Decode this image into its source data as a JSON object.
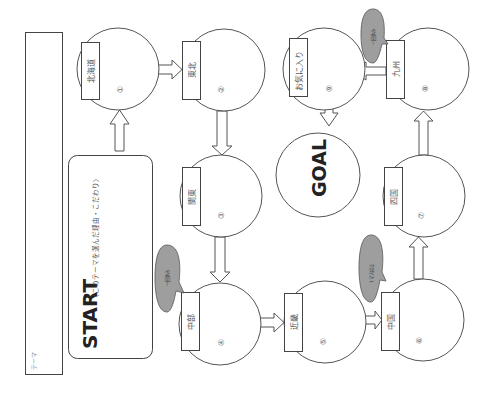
{
  "worksheet": {
    "orientation": "rotated-90-ccw",
    "theme_box": {
      "label": "テーマ"
    },
    "start": {
      "title": "START",
      "note": "〈このテーマを選んだ理由・こだわり〉"
    },
    "goal": {
      "label": "GOAL"
    },
    "stops": [
      {
        "number": "①",
        "region": "北海道"
      },
      {
        "number": "②",
        "region": "東北"
      },
      {
        "number": "③",
        "region": "関東"
      },
      {
        "number": "④",
        "region": "中部"
      },
      {
        "number": "⑤",
        "region": "近畿"
      },
      {
        "number": "⑥",
        "region": "中国"
      },
      {
        "number": "⑦",
        "region": "四国"
      },
      {
        "number": "⑧",
        "region": "九州"
      },
      {
        "number": "⑨",
        "region": "お気に入り"
      }
    ],
    "balloons": [
      {
        "attached_to": "④",
        "text": "一回休み"
      },
      {
        "attached_to": "⑥",
        "text": "1マス戻る"
      },
      {
        "attached_to": "⑧",
        "text": "一回休み"
      }
    ],
    "flow": [
      "START",
      "①",
      "②",
      "③",
      "④",
      "⑤",
      "⑥",
      "⑦",
      "⑧",
      "⑨",
      "GOAL"
    ]
  },
  "colors": {
    "line": "#555555",
    "balloon_fill": "#9e9e9e",
    "background": "#ffffff",
    "heading": "#222222"
  }
}
